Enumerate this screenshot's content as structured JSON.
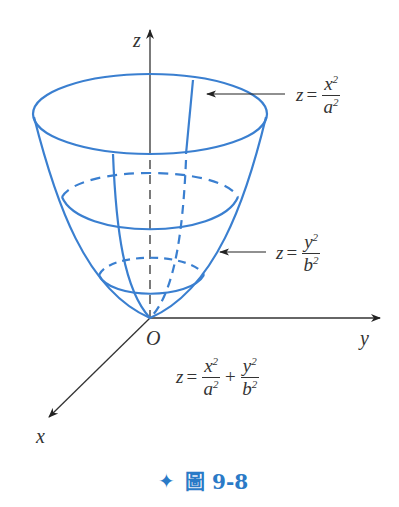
{
  "figure": {
    "axes": {
      "z_label": "z",
      "y_label": "y",
      "x_label": "x",
      "origin_label": "O"
    },
    "equations": {
      "xz_trace": {
        "lhs": "z",
        "eq": "=",
        "num": "x",
        "num_exp": "2",
        "den": "a",
        "den_exp": "2"
      },
      "yz_trace": {
        "lhs": "z",
        "eq": "=",
        "num": "y",
        "num_exp": "2",
        "den": "b",
        "den_exp": "2"
      },
      "surface": {
        "lhs": "z",
        "eq": "=",
        "t1_num": "x",
        "t1_num_exp": "2",
        "t1_den": "a",
        "t1_den_exp": "2",
        "plus": "+",
        "t2_num": "y",
        "t2_num_exp": "2",
        "t2_den": "b",
        "t2_den_exp": "2"
      }
    },
    "caption": {
      "marker": "✦",
      "text": "圖 9-8"
    },
    "colors": {
      "surface": "#3a7fd0",
      "axes": "#333333",
      "caption": "#2a7ac7"
    }
  }
}
